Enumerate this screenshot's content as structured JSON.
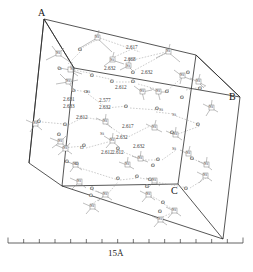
{
  "figure": {
    "kind": "crystal-structure-unit-cell",
    "background_color": "#ffffff",
    "edge_color": "#2b2b2b",
    "bond_color": "#8a8a8a",
    "hbond_color": "#9a9a9a"
  },
  "corner_labels": [
    {
      "text": "A",
      "x": 38,
      "y": 8
    },
    {
      "text": "B",
      "x": 229,
      "y": 92
    },
    {
      "text": "C",
      "x": 171,
      "y": 186
    }
  ],
  "scale": {
    "label": "15Å",
    "label_x": 108,
    "label_y": 253,
    "tick_count": 16,
    "x_start": 8,
    "x_end": 243,
    "y": 243,
    "tick_height": 4
  },
  "distances": [
    {
      "value": "2.617",
      "x": 126,
      "y": 45
    },
    {
      "value": "2.668",
      "x": 124,
      "y": 57
    },
    {
      "value": "2.632",
      "x": 104,
      "y": 66
    },
    {
      "value": "2.632",
      "x": 141,
      "y": 70
    },
    {
      "value": "2.612",
      "x": 115,
      "y": 85
    },
    {
      "value": "2.577",
      "x": 99,
      "y": 98
    },
    {
      "value": "2.632",
      "x": 99,
      "y": 105
    },
    {
      "value": "2.631",
      "x": 63,
      "y": 97
    },
    {
      "value": "2.633",
      "x": 63,
      "y": 104
    },
    {
      "value": "2.612",
      "x": 76,
      "y": 115
    },
    {
      "value": "2.617",
      "x": 122,
      "y": 124
    },
    {
      "value": "2.632",
      "x": 116,
      "y": 135
    },
    {
      "value": "2.632",
      "x": 133,
      "y": 144
    },
    {
      "value": "2.612",
      "x": 101,
      "y": 150
    },
    {
      "value": "2.612",
      "x": 112,
      "y": 150
    }
  ],
  "atoms": [
    {
      "species": "Si",
      "label": "Si",
      "x": 95,
      "y": 34
    },
    {
      "species": "O",
      "label": "O",
      "x": 78,
      "y": 47
    },
    {
      "species": "Si",
      "label": "Si",
      "x": 110,
      "y": 57
    },
    {
      "species": "Si",
      "label": "Si",
      "x": 126,
      "y": 63
    },
    {
      "species": "O",
      "label": "O",
      "x": 131,
      "y": 70
    },
    {
      "species": "Si",
      "label": "Si",
      "x": 166,
      "y": 48
    },
    {
      "species": "O",
      "label": "O",
      "x": 186,
      "y": 70
    },
    {
      "species": "Si",
      "label": "Si",
      "x": 180,
      "y": 72
    },
    {
      "species": "Si",
      "label": "Si",
      "x": 196,
      "y": 78
    },
    {
      "species": "O",
      "label": "O",
      "x": 198,
      "y": 86
    },
    {
      "species": "Si",
      "label": "Si",
      "x": 56,
      "y": 50
    },
    {
      "species": "O",
      "label": "O",
      "x": 58,
      "y": 66
    },
    {
      "species": "Si",
      "label": "Si",
      "x": 70,
      "y": 66
    },
    {
      "species": "O",
      "label": "O",
      "x": 90,
      "y": 73
    },
    {
      "species": "Si",
      "label": "Si",
      "x": 66,
      "y": 78
    },
    {
      "species": "O",
      "label": "O",
      "x": 110,
      "y": 79
    },
    {
      "species": "O",
      "label": "O",
      "x": 131,
      "y": 79
    },
    {
      "species": "O",
      "label": "O",
      "x": 72,
      "y": 88
    },
    {
      "species": "Si",
      "label": "Si",
      "x": 86,
      "y": 89
    },
    {
      "species": "O",
      "label": "O",
      "x": 84,
      "y": 89
    },
    {
      "species": "Si",
      "label": "Si",
      "x": 140,
      "y": 88
    },
    {
      "species": "Si",
      "label": "Si",
      "x": 156,
      "y": 88
    },
    {
      "species": "O",
      "label": "O",
      "x": 165,
      "y": 89
    },
    {
      "species": "O",
      "label": "O",
      "x": 180,
      "y": 95
    },
    {
      "species": "Si",
      "label": "Si",
      "x": 209,
      "y": 104
    },
    {
      "species": "O",
      "label": "O",
      "x": 124,
      "y": 104
    },
    {
      "species": "O",
      "label": "O",
      "x": 155,
      "y": 106
    },
    {
      "species": "Si",
      "label": "Si",
      "x": 159,
      "y": 107
    },
    {
      "species": "Si",
      "label": "Si",
      "x": 172,
      "y": 112
    },
    {
      "species": "O",
      "label": "O",
      "x": 37,
      "y": 119
    },
    {
      "species": "Si",
      "label": "Si",
      "x": 33,
      "y": 120
    },
    {
      "species": "O",
      "label": "O",
      "x": 63,
      "y": 122
    },
    {
      "species": "Si",
      "label": "Si",
      "x": 103,
      "y": 118
    },
    {
      "species": "O",
      "label": "O",
      "x": 57,
      "y": 132
    },
    {
      "species": "Si",
      "label": "Si",
      "x": 58,
      "y": 138
    },
    {
      "species": "Si",
      "label": "Si",
      "x": 152,
      "y": 124
    },
    {
      "species": "O",
      "label": "O",
      "x": 196,
      "y": 122
    },
    {
      "species": "O",
      "label": "O",
      "x": 170,
      "y": 130
    },
    {
      "species": "Si",
      "label": "Si",
      "x": 173,
      "y": 131
    },
    {
      "species": "Si",
      "label": "Si",
      "x": 100,
      "y": 131
    },
    {
      "species": "Si",
      "label": "Si",
      "x": 110,
      "y": 137
    },
    {
      "species": "O",
      "label": "O",
      "x": 116,
      "y": 146
    },
    {
      "species": "O",
      "label": "O",
      "x": 82,
      "y": 143
    },
    {
      "species": "Si",
      "label": "Si",
      "x": 63,
      "y": 145
    },
    {
      "species": "O",
      "label": "O",
      "x": 80,
      "y": 145
    },
    {
      "species": "Si",
      "label": "Si",
      "x": 172,
      "y": 146
    },
    {
      "species": "Si",
      "label": "Si",
      "x": 186,
      "y": 150
    },
    {
      "species": "O",
      "label": "O",
      "x": 190,
      "y": 156
    },
    {
      "species": "O",
      "label": "O",
      "x": 65,
      "y": 159
    },
    {
      "species": "Si",
      "label": "Si",
      "x": 73,
      "y": 161
    },
    {
      "species": "O",
      "label": "O",
      "x": 75,
      "y": 161
    },
    {
      "species": "Si",
      "label": "Si",
      "x": 138,
      "y": 155
    },
    {
      "species": "O",
      "label": "O",
      "x": 156,
      "y": 157
    },
    {
      "species": "Si",
      "label": "Si",
      "x": 125,
      "y": 161
    },
    {
      "species": "O",
      "label": "O",
      "x": 151,
      "y": 163
    },
    {
      "species": "Si",
      "label": "Si",
      "x": 204,
      "y": 161
    },
    {
      "species": "Si",
      "label": "Si",
      "x": 77,
      "y": 178
    },
    {
      "species": "O",
      "label": "O",
      "x": 116,
      "y": 176
    },
    {
      "species": "O",
      "label": "O",
      "x": 135,
      "y": 174
    },
    {
      "species": "O",
      "label": "O",
      "x": 148,
      "y": 177
    },
    {
      "species": "Si",
      "label": "Si",
      "x": 152,
      "y": 177
    },
    {
      "species": "O",
      "label": "O",
      "x": 145,
      "y": 184
    },
    {
      "species": "O",
      "label": "O",
      "x": 184,
      "y": 186
    },
    {
      "species": "Si",
      "label": "Si",
      "x": 203,
      "y": 172
    },
    {
      "species": "O",
      "label": "O",
      "x": 90,
      "y": 186
    },
    {
      "species": "Si",
      "label": "Si",
      "x": 103,
      "y": 191
    },
    {
      "species": "O",
      "label": "O",
      "x": 89,
      "y": 193
    },
    {
      "species": "Si",
      "label": "Si",
      "x": 146,
      "y": 191
    },
    {
      "species": "Si",
      "label": "Si",
      "x": 90,
      "y": 203
    },
    {
      "species": "O",
      "label": "O",
      "x": 161,
      "y": 200
    },
    {
      "species": "Si",
      "label": "Si",
      "x": 172,
      "y": 207
    },
    {
      "species": "O",
      "label": "O",
      "x": 158,
      "y": 209
    },
    {
      "species": "Si",
      "label": "Si",
      "x": 158,
      "y": 216
    }
  ]
}
